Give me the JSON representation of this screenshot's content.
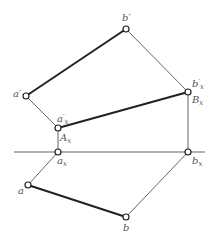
{
  "diagram": {
    "type": "orthographic-projection",
    "colors": {
      "thick_line": "#222222",
      "thin_line": "#555555",
      "axis": "#666666",
      "point_fill": "#ffffff",
      "label": "#555555"
    },
    "axis": {
      "x1": 14,
      "y1": 152,
      "x2": 205,
      "y2": 152
    },
    "points": {
      "b_prime": {
        "x": 126,
        "y": 29
      },
      "a_prime": {
        "x": 26,
        "y": 96
      },
      "a_prime_x": {
        "x": 58,
        "y": 128
      },
      "a_x": {
        "x": 58,
        "y": 152
      },
      "b_prime_x": {
        "x": 188,
        "y": 92
      },
      "b_x": {
        "x": 188,
        "y": 152
      },
      "a": {
        "x": 28,
        "y": 185
      },
      "b": {
        "x": 126,
        "y": 217
      }
    },
    "labels": {
      "b_prime": {
        "base": "b",
        "mark": "′",
        "sub": ""
      },
      "a_prime": {
        "base": "a",
        "mark": "′",
        "sub": ""
      },
      "a_prime_x": {
        "base": "a",
        "mark": "′",
        "sub": "x"
      },
      "A_x": {
        "base": "A",
        "mark": "",
        "sub": "x"
      },
      "a_x": {
        "base": "a",
        "mark": "",
        "sub": "x"
      },
      "b_prime_x": {
        "base": "b",
        "mark": "′",
        "sub": "x"
      },
      "B_x": {
        "base": "B",
        "mark": "",
        "sub": "x"
      },
      "b_x": {
        "base": "b",
        "mark": "",
        "sub": "x"
      },
      "a": {
        "base": "a",
        "mark": "",
        "sub": ""
      },
      "b": {
        "base": "b",
        "mark": "",
        "sub": ""
      }
    },
    "edges": [
      {
        "from": "a_prime",
        "to": "b_prime",
        "weight": "thick"
      },
      {
        "from": "a_prime_x",
        "to": "b_prime_x",
        "weight": "thick"
      },
      {
        "from": "a",
        "to": "b",
        "weight": "thick"
      },
      {
        "from": "b_prime",
        "to": "b_prime_x",
        "weight": "thin"
      },
      {
        "from": "a_prime",
        "to": "a_prime_x",
        "weight": "thin"
      },
      {
        "from": "a_prime_x",
        "to": "a_x",
        "weight": "thin"
      },
      {
        "from": "b_prime_x",
        "to": "b_x",
        "weight": "thin"
      },
      {
        "from": "a_x",
        "to": "a",
        "weight": "thin"
      },
      {
        "from": "b_x",
        "to": "b",
        "weight": "thin"
      }
    ]
  }
}
